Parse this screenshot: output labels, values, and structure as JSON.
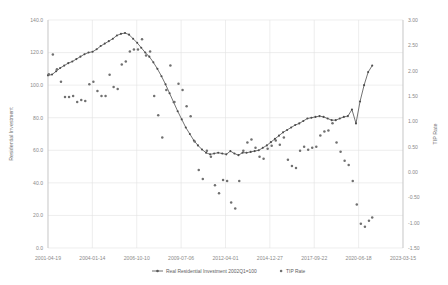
{
  "chart_data": {
    "type": "line",
    "title": "",
    "xlabel": "",
    "ylabel": "Residential Investment",
    "y2label": "TIP Rate",
    "grid": true,
    "legend_position": "bottom",
    "xlim": [
      "2001-04-19",
      "2023-03-15"
    ],
    "ylim": [
      0.0,
      140.0
    ],
    "y2lim": [
      -1.5,
      3.0
    ],
    "x_tick_labels": [
      "2001-04-19",
      "2004-01-14",
      "2006-10-10",
      "2009-07-06",
      "2012-04-01",
      "2014-12-27",
      "2017-09-22",
      "2020-06-18",
      "2023-03-15"
    ],
    "y_tick_labels": [
      "0.0",
      "20.0",
      "40.0",
      "60.0",
      "80.0",
      "100.0",
      "120.0",
      "140.0"
    ],
    "y2_tick_labels": [
      "-1.50",
      "-1.00",
      "-0.50",
      "0.00",
      "0.50",
      "1.00",
      "1.50",
      "2.00",
      "2.50",
      "3.00"
    ],
    "series": [
      {
        "name": "Real Residential Investment 2002Q1=100",
        "type": "line",
        "axis": "left",
        "color": "#595959",
        "x": [
          2001.3,
          2001.55,
          2001.8,
          2002.05,
          2002.3,
          2002.55,
          2002.8,
          2003.05,
          2003.3,
          2003.55,
          2003.8,
          2004.05,
          2004.3,
          2004.55,
          2004.8,
          2005.05,
          2005.3,
          2005.55,
          2005.8,
          2006.05,
          2006.3,
          2006.55,
          2006.8,
          2007.05,
          2007.3,
          2007.55,
          2007.8,
          2008.05,
          2008.3,
          2008.55,
          2008.8,
          2009.05,
          2009.3,
          2009.55,
          2009.8,
          2010.05,
          2010.3,
          2010.55,
          2010.8,
          2011.05,
          2011.3,
          2011.55,
          2011.8,
          2012.05,
          2012.3,
          2012.55,
          2012.8,
          2013.05,
          2013.3,
          2013.55,
          2013.8,
          2014.05,
          2014.3,
          2014.55,
          2014.8,
          2015.05,
          2015.3,
          2015.55,
          2015.8,
          2016.05,
          2016.3,
          2016.55,
          2016.8,
          2017.05,
          2017.3,
          2017.55,
          2017.8,
          2018.05,
          2018.3,
          2018.55,
          2018.8,
          2019.05,
          2019.3,
          2019.55,
          2019.8,
          2020.05,
          2020.3,
          2020.55,
          2020.8,
          2021.05,
          2021.3
        ],
        "values": [
          106.0,
          106.5,
          108.5,
          110.5,
          112.0,
          113.5,
          114.5,
          116.0,
          117.5,
          119.0,
          120.0,
          120.5,
          122.0,
          124.0,
          125.5,
          127.0,
          128.5,
          130.5,
          131.5,
          132.0,
          131.0,
          128.5,
          126.0,
          123.0,
          120.0,
          117.5,
          114.0,
          110.0,
          105.5,
          100.5,
          95.0,
          89.5,
          84.0,
          79.0,
          74.0,
          70.0,
          66.0,
          63.0,
          60.5,
          58.5,
          57.5,
          58.0,
          58.5,
          58.0,
          57.5,
          59.5,
          58.0,
          57.0,
          58.5,
          58.5,
          59.0,
          59.5,
          60.0,
          61.5,
          63.0,
          65.0,
          67.0,
          69.0,
          71.0,
          72.5,
          74.0,
          75.5,
          76.5,
          78.0,
          79.5,
          80.0,
          80.5,
          81.0,
          80.5,
          79.5,
          78.5,
          78.5,
          79.5,
          80.5,
          81.0,
          85.0,
          76.5,
          90.0,
          100.0,
          108.0,
          112.0
        ]
      },
      {
        "name": "TIP Rate",
        "type": "scatter",
        "axis": "right",
        "color": "#707070",
        "x": [
          2001.35,
          2001.6,
          2001.85,
          2002.1,
          2002.35,
          2002.6,
          2002.85,
          2003.1,
          2003.35,
          2003.6,
          2003.85,
          2004.1,
          2004.35,
          2004.6,
          2004.85,
          2005.1,
          2005.35,
          2005.6,
          2005.85,
          2006.1,
          2006.35,
          2006.6,
          2006.85,
          2007.1,
          2007.35,
          2007.6,
          2007.85,
          2008.1,
          2008.35,
          2008.6,
          2008.85,
          2009.1,
          2009.35,
          2009.6,
          2009.85,
          2010.1,
          2010.35,
          2010.6,
          2010.85,
          2011.1,
          2011.35,
          2011.6,
          2011.85,
          2012.1,
          2012.35,
          2012.6,
          2012.85,
          2013.1,
          2013.35,
          2013.6,
          2013.85,
          2014.1,
          2014.35,
          2014.6,
          2014.85,
          2015.1,
          2015.35,
          2015.6,
          2015.85,
          2016.1,
          2016.35,
          2016.6,
          2016.85,
          2017.1,
          2017.35,
          2017.6,
          2017.85,
          2018.1,
          2018.35,
          2018.6,
          2018.85,
          2019.1,
          2019.35,
          2019.6,
          2019.85,
          2020.1,
          2020.35,
          2020.6,
          2020.85,
          2021.1,
          2021.3
        ],
        "values": [
          1.93,
          2.32,
          2.03,
          1.78,
          1.48,
          1.48,
          1.5,
          1.38,
          1.42,
          1.4,
          1.73,
          1.78,
          1.6,
          1.5,
          1.5,
          1.92,
          1.68,
          1.64,
          2.12,
          2.18,
          2.38,
          2.42,
          2.42,
          2.62,
          2.3,
          2.38,
          1.5,
          1.12,
          0.68,
          1.62,
          2.1,
          1.38,
          1.74,
          1.62,
          1.3,
          1.1,
          0.6,
          0.04,
          -0.14,
          0.42,
          0.3,
          -0.26,
          -0.42,
          -0.16,
          -0.18,
          -0.6,
          -0.72,
          -0.18,
          0.42,
          0.58,
          0.64,
          0.48,
          0.3,
          0.26,
          0.46,
          0.52,
          0.62,
          0.54,
          0.68,
          0.24,
          0.12,
          0.08,
          0.42,
          0.5,
          0.44,
          0.48,
          0.5,
          0.72,
          0.8,
          0.82,
          0.96,
          0.58,
          0.4,
          0.22,
          0.14,
          -0.18,
          -0.64,
          -1.02,
          -1.08,
          -0.96,
          -0.9
        ]
      }
    ]
  },
  "legend": {
    "items": [
      {
        "label": "Real Residential Investment 2002Q1=100",
        "marker": "line-marker",
        "color": "#595959"
      },
      {
        "label": "TIP Rate",
        "marker": "dot-marker",
        "color": "#707070"
      }
    ]
  }
}
